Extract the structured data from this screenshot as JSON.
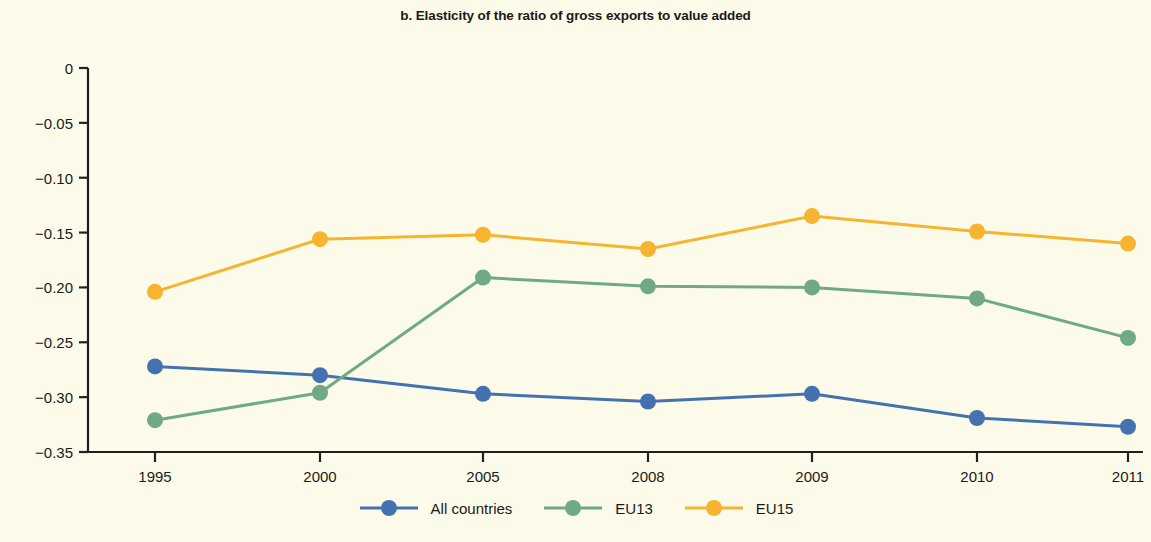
{
  "chart_data": {
    "type": "line",
    "title": "b. Elasticity of the ratio of gross exports to value added",
    "xlabel": "",
    "ylabel": "",
    "x": [
      "1995",
      "2000",
      "2005",
      "2008",
      "2009",
      "2010",
      "2011"
    ],
    "categories": [
      "1995",
      "2000",
      "2005",
      "2008",
      "2009",
      "2010",
      "2011"
    ],
    "ylim": [
      -0.35,
      0
    ],
    "yticks": [
      0,
      -0.05,
      -0.1,
      -0.15,
      -0.2,
      -0.25,
      -0.3,
      -0.35
    ],
    "ytick_labels": [
      "0",
      "−0.05",
      "−0.10",
      "−0.15",
      "−0.20",
      "−0.25",
      "−0.30",
      "−0.35"
    ],
    "grid": false,
    "legend_position": "bottom",
    "markers": "circle",
    "series": [
      {
        "name": "All countries",
        "color": "#4472b0",
        "values": [
          -0.272,
          -0.28,
          -0.297,
          -0.304,
          -0.297,
          -0.319,
          -0.327
        ]
      },
      {
        "name": "EU13",
        "color": "#6faa85",
        "values": [
          -0.321,
          -0.296,
          -0.191,
          -0.199,
          -0.2,
          -0.21,
          -0.246
        ]
      },
      {
        "name": "EU15",
        "color": "#f6b431",
        "values": [
          -0.204,
          -0.156,
          -0.152,
          -0.165,
          -0.135,
          -0.149,
          -0.16
        ]
      }
    ]
  },
  "colors": {
    "background": "#fcfbe9",
    "axis": "#231f20",
    "text": "#1a1a1a",
    "all_countries": "#4472b0",
    "eu13": "#6faa85",
    "eu15": "#f6b431"
  }
}
